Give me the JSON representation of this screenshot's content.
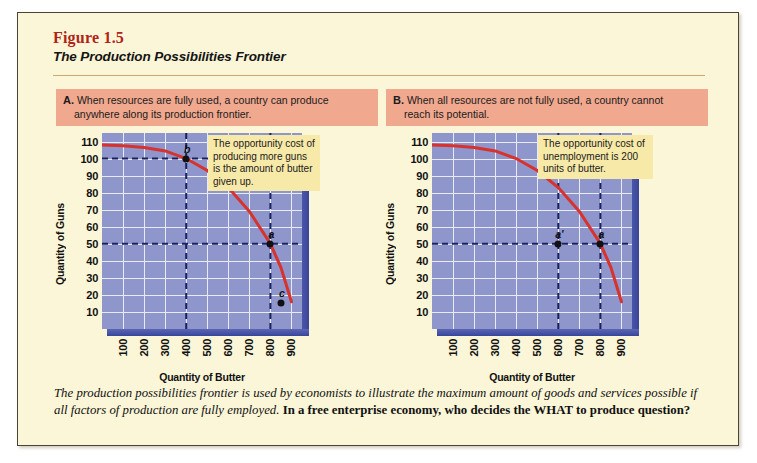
{
  "figure": {
    "number": "Figure 1.5",
    "title": "The Production Possibilities Frontier"
  },
  "panels": [
    {
      "letter": "A.",
      "caption_line1": "When resources are fully used, a country can produce",
      "caption_line2": "anywhere along its production frontier.",
      "callout": "The opportunity cost of producing more guns is the amount of butter given up."
    },
    {
      "letter": "B.",
      "caption_line1": "When all resources are not fully used, a country cannot",
      "caption_line2": "reach its potential.",
      "callout": "The opportunity cost of unemployment is 200 units of butter."
    }
  ],
  "bottom_caption": {
    "italic_text": "The production possibilities frontier is used by economists to illustrate the maximum amount of goods and services possible if all factors of production are fully employed.",
    "bold_question": "In a free enterprise economy, who decides the WHAT to produce question?"
  },
  "colors": {
    "page_background": "#fbf6d8",
    "panel_caption": "#f0a88e",
    "callout": "#f7e9a8",
    "plot_background": "#8e96cc",
    "gridline": "#e8eaf6",
    "curve": "#d8322c",
    "dashed_line": "#1b2060",
    "figure_number": "#b02418"
  },
  "chart_data": [
    {
      "type": "line",
      "title": "A. Production possibilities frontier — full employment",
      "xlabel": "Quantity of Butter",
      "ylabel": "Quantity of Guns",
      "xlim": [
        0,
        950
      ],
      "ylim": [
        0,
        115
      ],
      "xticks": [
        100,
        200,
        300,
        400,
        500,
        600,
        700,
        800,
        900
      ],
      "yticks": [
        10,
        20,
        30,
        40,
        50,
        60,
        70,
        80,
        90,
        100,
        110
      ],
      "grid": true,
      "legend": "none",
      "series": [
        {
          "name": "Production possibilities frontier",
          "color": "#d8322c",
          "x": [
            0,
            100,
            200,
            300,
            400,
            500,
            600,
            700,
            800,
            850,
            900
          ],
          "y": [
            108,
            107.5,
            106.5,
            104.5,
            100,
            93,
            83,
            69,
            50,
            36,
            16
          ]
        }
      ],
      "points": [
        {
          "label": "b",
          "x": 400,
          "y": 100,
          "note": "on the frontier"
        },
        {
          "label": "a",
          "x": 800,
          "y": 50,
          "note": "on the frontier"
        },
        {
          "label": "c",
          "x": 850,
          "y": 15,
          "note": "inside the frontier"
        }
      ],
      "guide_lines": [
        {
          "orientation": "horizontal",
          "value": 100,
          "style": "dashed"
        },
        {
          "orientation": "vertical",
          "value": 400,
          "style": "dashed"
        },
        {
          "orientation": "horizontal",
          "value": 50,
          "style": "dashed"
        },
        {
          "orientation": "vertical",
          "value": 800,
          "style": "dashed"
        }
      ]
    },
    {
      "type": "line",
      "title": "B. Production possibilities frontier — unemployment",
      "xlabel": "Quantity of Butter",
      "ylabel": "Quantity of Guns",
      "xlim": [
        0,
        950
      ],
      "ylim": [
        0,
        115
      ],
      "xticks": [
        100,
        200,
        300,
        400,
        500,
        600,
        700,
        800,
        900
      ],
      "yticks": [
        10,
        20,
        30,
        40,
        50,
        60,
        70,
        80,
        90,
        100,
        110
      ],
      "grid": true,
      "legend": "none",
      "series": [
        {
          "name": "Production possibilities frontier",
          "color": "#d8322c",
          "x": [
            0,
            100,
            200,
            300,
            400,
            500,
            600,
            700,
            800,
            850,
            900
          ],
          "y": [
            108,
            107.5,
            106.5,
            104.5,
            100,
            93,
            83,
            69,
            50,
            36,
            16
          ]
        }
      ],
      "points": [
        {
          "label": "a'",
          "x": 600,
          "y": 50,
          "note": "inside the frontier — unemployment"
        },
        {
          "label": "a",
          "x": 800,
          "y": 50,
          "note": "on the frontier"
        }
      ],
      "guide_lines": [
        {
          "orientation": "horizontal",
          "value": 50,
          "style": "dashed"
        },
        {
          "orientation": "vertical",
          "value": 600,
          "style": "dashed"
        },
        {
          "orientation": "vertical",
          "value": 800,
          "style": "dashed"
        }
      ]
    }
  ]
}
